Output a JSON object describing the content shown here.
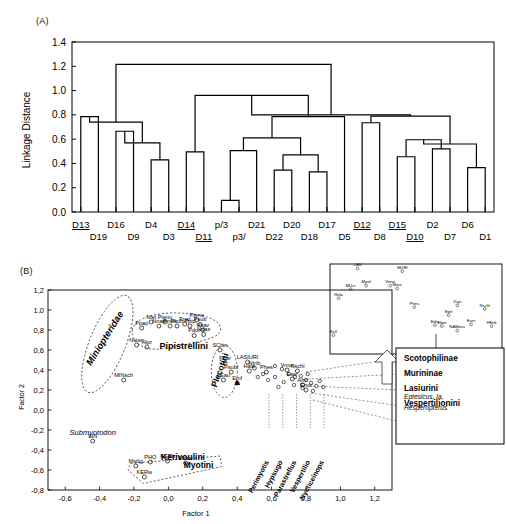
{
  "figure": {
    "panel_a_tag": "(A)",
    "panel_b_tag": "(B)"
  },
  "panel_a": {
    "ylabel": "Linkage Distance",
    "yticks": [
      "0.0",
      "0.2",
      "0.4",
      "0.6",
      "0.8",
      "1.0",
      "1.2",
      "1.4"
    ],
    "ylim": [
      0.0,
      1.4
    ],
    "leaf_labels_top": [
      "D13",
      "D16",
      "D4",
      "D14",
      "p/3",
      "D21",
      "D20",
      "D17",
      "D12",
      "D15",
      "D2",
      "D6"
    ],
    "leaf_labels_bottom": [
      "D19",
      "D9",
      "D3",
      "D11",
      "p3/",
      "D22",
      "D18",
      "D5",
      "D8",
      "D10",
      "D7",
      "D1"
    ],
    "leaves": [
      {
        "label": "D13",
        "row": "top",
        "underlined": true
      },
      {
        "label": "D19",
        "row": "bottom",
        "underlined": false
      },
      {
        "label": "D16",
        "row": "top",
        "underlined": false
      },
      {
        "label": "D9",
        "row": "bottom",
        "underlined": false
      },
      {
        "label": "D4",
        "row": "top",
        "underlined": false
      },
      {
        "label": "D3",
        "row": "bottom",
        "underlined": false
      },
      {
        "label": "D14",
        "row": "top",
        "underlined": true
      },
      {
        "label": "D11",
        "row": "bottom",
        "underlined": true
      },
      {
        "label": "p/3",
        "row": "top",
        "underlined": false
      },
      {
        "label": "p3/",
        "row": "bottom",
        "underlined": false
      },
      {
        "label": "D21",
        "row": "top",
        "underlined": false
      },
      {
        "label": "D22",
        "row": "bottom",
        "underlined": false
      },
      {
        "label": "D20",
        "row": "top",
        "underlined": false
      },
      {
        "label": "D18",
        "row": "bottom",
        "underlined": false
      },
      {
        "label": "D17",
        "row": "top",
        "underlined": false
      },
      {
        "label": "D5",
        "row": "bottom",
        "underlined": false
      },
      {
        "label": "D12",
        "row": "top",
        "underlined": true
      },
      {
        "label": "D8",
        "row": "bottom",
        "underlined": false
      },
      {
        "label": "D15",
        "row": "top",
        "underlined": true
      },
      {
        "label": "D10",
        "row": "bottom",
        "underlined": true
      },
      {
        "label": "D2",
        "row": "top",
        "underlined": false
      },
      {
        "label": "D7",
        "row": "bottom",
        "underlined": false
      },
      {
        "label": "D6",
        "row": "top",
        "underlined": false
      },
      {
        "label": "D1",
        "row": "bottom",
        "underlined": false
      }
    ],
    "merges": [
      {
        "id": "m1",
        "left": "D13",
        "right": "D19",
        "height": 0.785
      },
      {
        "id": "m2",
        "left": "D16",
        "right": "D9",
        "height": 0.665
      },
      {
        "id": "m3",
        "left": "D4",
        "right": "D3",
        "height": 0.43
      },
      {
        "id": "m4",
        "left": "m3",
        "right": "m2",
        "height": 0.57
      },
      {
        "id": "m5",
        "left": "m4",
        "right": "m1",
        "height": 0.74
      },
      {
        "id": "m6",
        "left": "p/3",
        "right": "p3/",
        "height": 0.095
      },
      {
        "id": "m7",
        "left": "m6",
        "right": "D21",
        "height": 0.505
      },
      {
        "id": "m8",
        "left": "D14",
        "right": "D11",
        "height": 0.495
      },
      {
        "id": "m9",
        "left": "D20",
        "right": "D22",
        "height": 0.345
      },
      {
        "id": "m10",
        "left": "D17",
        "right": "D18",
        "height": 0.33
      },
      {
        "id": "m11",
        "left": "m9",
        "right": "m10",
        "height": 0.47
      },
      {
        "id": "m12",
        "left": "m7",
        "right": "m11",
        "height": 0.61
      },
      {
        "id": "m13",
        "left": "m12",
        "right": "D5",
        "height": 0.785
      },
      {
        "id": "m14",
        "left": "m8",
        "right": "m13",
        "height": 0.96
      },
      {
        "id": "m15",
        "left": "D15",
        "right": "D10",
        "height": 0.455
      },
      {
        "id": "m16",
        "left": "D2",
        "right": "D7",
        "height": 0.52
      },
      {
        "id": "m17",
        "left": "m15",
        "right": "m16",
        "height": 0.595
      },
      {
        "id": "m18",
        "left": "D6",
        "right": "D1",
        "height": 0.365
      },
      {
        "id": "m19",
        "left": "m17",
        "right": "m18",
        "height": 0.56
      },
      {
        "id": "m20",
        "left": "D12",
        "right": "D8",
        "height": 0.735
      },
      {
        "id": "m21",
        "left": "m20",
        "right": "m19",
        "height": 0.79
      },
      {
        "id": "m22",
        "left": "m14",
        "right": "m21",
        "height": 0.8
      },
      {
        "id": "m23",
        "left": "m5",
        "right": "m22",
        "height": 1.215
      }
    ]
  },
  "panel_b": {
    "xlabel": "Factor 1",
    "ylabel": "Factor 2",
    "xticks": [
      "-0,6",
      "-0,4",
      "-0,2",
      "0,0",
      "0,2",
      "0,4",
      "0,6",
      "0,8",
      "1,0",
      "1,2"
    ],
    "yticks": [
      "-0,8",
      "-0,6",
      "-0,4",
      "-0,2",
      "0,0",
      "0,2",
      "0,4",
      "0,6",
      "0,8",
      "1,0",
      "1,2"
    ],
    "xlim": [
      -0.7,
      1.3
    ],
    "ylim": [
      -0.8,
      1.2
    ],
    "group_labels": [
      {
        "name": "Miniopteridae",
        "style": "bold-italic-rotated"
      },
      {
        "name": "Pipistrellini",
        "style": "bold"
      },
      {
        "name": "Plecotini",
        "style": "bold-rotated"
      },
      {
        "name": "Kerivoulini",
        "style": "bold"
      },
      {
        "name": "Myotini",
        "style": "bold"
      },
      {
        "name": "LASIURI",
        "style": "plain"
      },
      {
        "name": "Submyotodon",
        "style": "italic"
      }
    ],
    "points": [
      {
        "label": "MINsch",
        "x": -0.26,
        "y": 0.3
      },
      {
        "label": "SIN",
        "x": -0.44,
        "y": -0.31
      },
      {
        "label": "Ppap",
        "x": -0.155,
        "y": 0.82
      },
      {
        "label": "Nsten",
        "x": -0.185,
        "y": 0.65
      },
      {
        "label": "Hipr",
        "x": -0.125,
        "y": 0.63
      },
      {
        "label": "Nlei",
        "x": -0.1,
        "y": 0.88
      },
      {
        "label": "Nnan",
        "x": -0.055,
        "y": 0.84
      },
      {
        "label": "Ptenu",
        "x": -0.02,
        "y": 0.88
      },
      {
        "label": "Pmim",
        "x": 0.01,
        "y": 0.84
      },
      {
        "label": "Pkuh",
        "x": 0.05,
        "y": 0.84
      },
      {
        "label": "Pnat",
        "x": 0.095,
        "y": 0.86
      },
      {
        "label": "Ppip",
        "x": 0.125,
        "y": 0.84
      },
      {
        "label": "Ptene",
        "x": 0.165,
        "y": 0.9
      },
      {
        "label": "Psub",
        "x": 0.185,
        "y": 0.855
      },
      {
        "label": "Hsav",
        "x": 0.2,
        "y": 0.8
      },
      {
        "label": "Pdor",
        "x": 0.15,
        "y": 0.745
      },
      {
        "label": "Ndas",
        "x": 0.205,
        "y": 0.755
      },
      {
        "label": "SChin",
        "x": 0.3,
        "y": 0.6
      },
      {
        "label": "Pbar",
        "x": 0.33,
        "y": 0.47
      },
      {
        "label": "LEau",
        "x": 0.32,
        "y": 0.3
      },
      {
        "label": "Psubf",
        "x": 0.365,
        "y": 0.38
      },
      {
        "label": "Emf",
        "x": 0.4,
        "y": 0.27
      },
      {
        "label": "LASIURI",
        "x": 0.46,
        "y": 0.48
      },
      {
        "label": "Ntrib",
        "x": 0.5,
        "y": 0.42
      },
      {
        "label": "Hala",
        "x": 0.47,
        "y": 0.39
      },
      {
        "label": "Phes",
        "x": 0.57,
        "y": 0.38
      },
      {
        "label": "Vmur",
        "x": 0.69,
        "y": 0.4
      },
      {
        "label": "Nschl",
        "x": 0.75,
        "y": 0.39
      },
      {
        "label": "Eser",
        "x": 0.72,
        "y": 0.31
      },
      {
        "label": "Afro",
        "x": 0.78,
        "y": 0.25
      },
      {
        "label": "Ehot",
        "x": 0.8,
        "y": 0.2
      },
      {
        "label": "KERh",
        "x": -0.005,
        "y": -0.51
      },
      {
        "label": "KERw",
        "x": -0.14,
        "y": -0.67
      },
      {
        "label": "PHO",
        "x": -0.105,
        "y": -0.52
      },
      {
        "label": "Msilig",
        "x": -0.19,
        "y": -0.56
      },
      {
        "label": "Mdav",
        "x": 0.1,
        "y": -0.53
      }
    ],
    "genus_labels": [
      "Perimyotis",
      "Hypsugo",
      "Parastrellus",
      "Vespertilio",
      "Nycticeinops"
    ],
    "legend": {
      "items": [
        {
          "label": "Scotophilinae",
          "style": "bold"
        },
        {
          "label": "Murininae",
          "style": "bold"
        },
        {
          "label": "Lasiurini",
          "style": "bold"
        },
        {
          "label": "Vespertilionini",
          "style": "bold"
        },
        {
          "label": "Eptesicus, Ia,",
          "style": "italic"
        },
        {
          "label": "Hesperopterus",
          "style": "italic"
        }
      ]
    },
    "inset": {
      "points": [
        {
          "label": "LAS",
          "x": 0.16,
          "y": 0.95
        },
        {
          "label": "MURI",
          "x": 0.42,
          "y": 0.92
        },
        {
          "label": "MUcr",
          "x": 0.12,
          "y": 0.72
        },
        {
          "label": "Mpol",
          "x": 0.21,
          "y": 0.76
        },
        {
          "label": "Vmur",
          "x": 0.35,
          "y": 0.76
        },
        {
          "label": "Mrav",
          "x": 0.39,
          "y": 0.73
        },
        {
          "label": "Hala",
          "x": 0.05,
          "y": 0.62
        },
        {
          "label": "Phes",
          "x": 0.49,
          "y": 0.52
        },
        {
          "label": "Vspi",
          "x": 0.74,
          "y": 0.54
        },
        {
          "label": "Nschl",
          "x": 0.9,
          "y": 0.5
        },
        {
          "label": "Eprl",
          "x": 0.69,
          "y": 0.43
        },
        {
          "label": "Edis",
          "x": 0.61,
          "y": 0.32
        },
        {
          "label": "Ebot",
          "x": 0.65,
          "y": 0.31
        },
        {
          "label": "Eser",
          "x": 0.82,
          "y": 0.33
        },
        {
          "label": "HEtik",
          "x": 0.94,
          "y": 0.31
        },
        {
          "label": "NAMoss",
          "x": 0.74,
          "y": 0.26
        },
        {
          "label": "Esll",
          "x": 0.02,
          "y": 0.21
        }
      ]
    }
  }
}
